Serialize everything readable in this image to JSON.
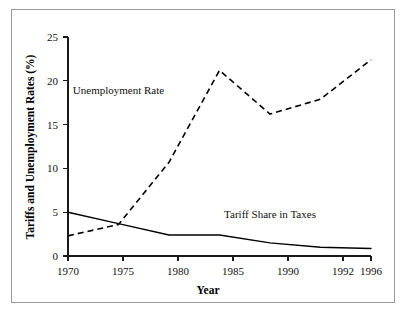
{
  "figure": {
    "border_color": "#9a9a9a",
    "background": "#ffffff"
  },
  "chart_data": {
    "type": "line",
    "title": "",
    "xlabel": "Year",
    "ylabel": "Tariffs and Unemployment Rates (%)",
    "categories": [
      "1970",
      "1975",
      "1980",
      "1985",
      "1990",
      "1992",
      "1996"
    ],
    "ylim": [
      0,
      25
    ],
    "yticks": [
      0,
      5,
      10,
      15,
      20,
      25
    ],
    "ytick_labels": [
      "0",
      "5",
      "10",
      "15",
      "20",
      "25"
    ],
    "grid": false,
    "legend": "annotations-inline",
    "series": [
      {
        "name": "Unemployment Rate",
        "style": "dashed",
        "color": "#000000",
        "values": [
          2.3,
          3.6,
          10.7,
          21.2,
          16.2,
          17.9,
          22.4
        ],
        "annotation": {
          "text": "Unemployment Rate",
          "x_category": "1975",
          "y_value": 18.5
        }
      },
      {
        "name": "Tariff Share in Taxes",
        "style": "solid",
        "color": "#000000",
        "values": [
          5.0,
          3.7,
          2.4,
          2.4,
          1.5,
          1.0,
          0.85
        ],
        "annotation": {
          "text": "Tariff Share in Taxes",
          "x_category": "1990",
          "y_value": 4.3
        }
      }
    ]
  }
}
